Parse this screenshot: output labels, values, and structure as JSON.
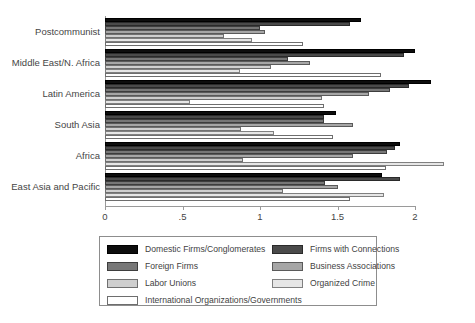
{
  "chart_data": {
    "type": "bar",
    "orientation": "horizontal",
    "title": "",
    "xlabel": "",
    "ylabel": "",
    "xlim": [
      0,
      2.35
    ],
    "xticks": [
      0,
      0.5,
      1,
      1.5,
      2
    ],
    "xticklabels": [
      "0",
      ".5",
      "1",
      "1.5",
      "2"
    ],
    "grid": false,
    "legend_position": "bottom",
    "categories": [
      "Postcommunist",
      "Middle East/N. Africa",
      "Latin America",
      "South Asia",
      "Africa",
      "East Asia and Pacific"
    ],
    "series": [
      {
        "name": "Domestic Firms/Conglomerates",
        "color": "#0d0d0d",
        "values": [
          1.65,
          2.0,
          2.1,
          1.49,
          1.9,
          1.79
        ]
      },
      {
        "name": "Firms with Connections",
        "color": "#4a4a4a",
        "values": [
          1.58,
          1.93,
          1.96,
          1.41,
          1.87,
          1.9
        ]
      },
      {
        "name": "Foreign Firms",
        "color": "#777777",
        "values": [
          1.0,
          1.18,
          1.84,
          1.41,
          1.82,
          1.42
        ]
      },
      {
        "name": "Business Associations",
        "color": "#a6a6a6",
        "values": [
          1.03,
          1.32,
          1.7,
          1.6,
          1.6,
          1.5
        ]
      },
      {
        "name": "Labor Unions",
        "color": "#cfcfcf",
        "values": [
          0.77,
          1.07,
          1.4,
          0.88,
          0.89,
          1.15
        ]
      },
      {
        "name": "Organized Crime",
        "color": "#e6e6e6",
        "values": [
          0.95,
          0.87,
          0.55,
          1.09,
          2.19,
          1.8
        ]
      },
      {
        "name": "International Organizations/Governments",
        "color": "#ffffff",
        "values": [
          1.28,
          1.78,
          1.41,
          1.47,
          1.81,
          1.58
        ]
      }
    ]
  },
  "legend": {
    "left_items": [
      "Domestic Firms/Conglomerates",
      "Foreign Firms",
      "Labor Unions",
      "International Organizations/Governments"
    ],
    "right_items": [
      "Firms with Connections",
      "Business Associations",
      "Organized Crime"
    ]
  }
}
